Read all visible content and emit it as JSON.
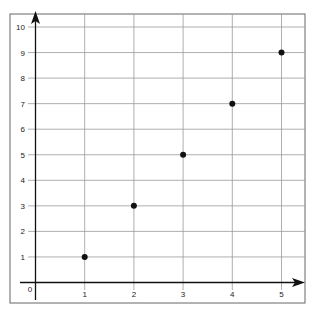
{
  "chart_data": {
    "type": "scatter",
    "title": "",
    "xlabel": "",
    "ylabel": "",
    "x": [
      1,
      2,
      3,
      4,
      5
    ],
    "y": [
      1,
      3,
      5,
      7,
      9
    ],
    "series": [
      {
        "name": "points",
        "x": [
          1,
          2,
          3,
          4,
          5
        ],
        "y": [
          1,
          3,
          5,
          7,
          9
        ]
      }
    ],
    "xticks": [
      1,
      2,
      3,
      4,
      5
    ],
    "yticks": [
      1,
      2,
      3,
      4,
      5,
      6,
      7,
      8,
      9,
      10
    ],
    "origin_label": "0",
    "xlim": [
      0,
      5.5
    ],
    "ylim": [
      0,
      10.5
    ],
    "grid": true,
    "legend": null
  },
  "style": {
    "grid_color": "#9a9a9a",
    "axis_color": "#111111",
    "point_color": "#111111",
    "frame_color": "#666666"
  }
}
